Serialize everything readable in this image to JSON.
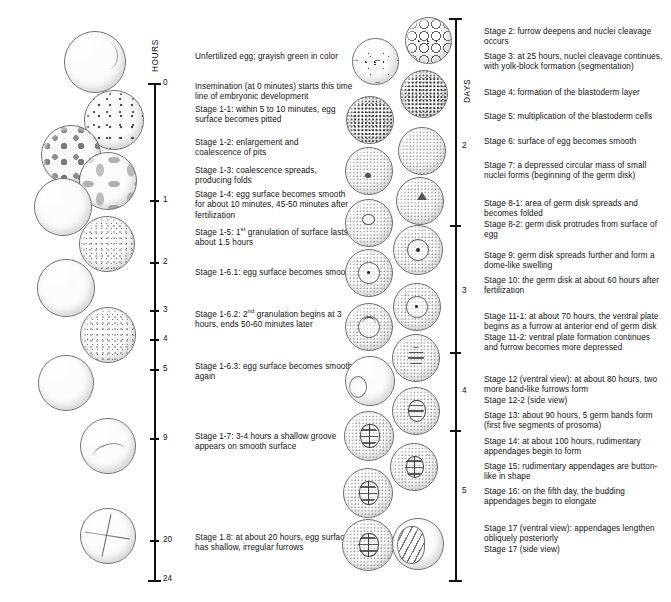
{
  "figure": {
    "left_axis": {
      "name": "HOURS",
      "ticks": [
        "0",
        "1",
        "2",
        "3",
        "4",
        "5",
        "9",
        "20",
        "24"
      ]
    },
    "right_axis": {
      "name": "DAYS",
      "ticks": [
        "2",
        "3",
        "4",
        "5"
      ]
    }
  },
  "left_captions": [
    {
      "id": "unfertilized",
      "text": "Unfertilized egg; grayish green in color"
    },
    {
      "id": "insemination",
      "text": "Insemination (at 0 minutes) starts this time line of embryonic development"
    },
    {
      "id": "stage-1-1",
      "text": "Stage 1-1: within 5 to 10 minutes, egg surface becomes pitted"
    },
    {
      "id": "stage-1-2",
      "text": "Stage 1-2: enlargement and coalescence of pits"
    },
    {
      "id": "stage-1-3",
      "text": "Stage 1-3: coalescence spreads, producing folds"
    },
    {
      "id": "stage-1-4",
      "text": "Stage 1-4: egg surface becomes smooth for about 10 minutes, 45-50 minutes after fertilization"
    },
    {
      "id": "stage-1-5",
      "text": "Stage 1-5: 1st granulation of surface lasts about 1.5 hours",
      "sup_token": "st",
      "prefix": "Stage 1-5: 1",
      "suffix": " granulation of surface lasts about 1.5 hours"
    },
    {
      "id": "stage-1-6-1",
      "text": "Stage 1-6.1: egg surface becomes smooth"
    },
    {
      "id": "stage-1-6-2",
      "text": "Stage 1-6.2: 2nd granulation begins at 3 hours, ends 50-60 minutes later",
      "sup_token": "nd",
      "prefix": "Stage 1-6.2: 2",
      "suffix": " granulation begins at 3 hours, ends 50-60 minutes later"
    },
    {
      "id": "stage-1-6-3",
      "text": "Stage 1-6.3: egg surface becomes smooth again"
    },
    {
      "id": "stage-1-7",
      "text": "Stage 1-7: 3-4 hours a shallow groove appears on smooth surface"
    },
    {
      "id": "stage-1-8",
      "text": "Stage 1.8: at about 20 hours, egg surface has shallow, irregular furrows"
    }
  ],
  "right_captions": [
    {
      "id": "stage-2",
      "text": "Stage 2: furrow deepens and nuclei cleavage occurs"
    },
    {
      "id": "stage-3",
      "text": "Stage 3: at 25 hours, nuclei cleavage continues, with yolk-block formation (segmentation)"
    },
    {
      "id": "stage-4",
      "text": "Stage 4: formation of the blastoderm layer"
    },
    {
      "id": "stage-5",
      "text": "Stage 5: multiplication of the blastoderm cells"
    },
    {
      "id": "stage-6",
      "text": "Stage 6: surface of egg becomes smooth"
    },
    {
      "id": "stage-7",
      "text": "Stage 7: a depressed circular mass of small nuclei forms (beginning of the germ disk)"
    },
    {
      "id": "stage-8",
      "text": "Stage 8-1: area of germ disk spreads and becomes folded\nStage 8-2: germ disk protrudes from surface of egg"
    },
    {
      "id": "stage-9",
      "text": "Stage 9: germ disk spreads further and form a dome-like swelling"
    },
    {
      "id": "stage-10",
      "text": "Stage 10: the germ disk at about 60 hours after fertilization"
    },
    {
      "id": "stage-11",
      "text": "Stage 11-1: at about 70 hours, the ventral plate begins as a furrow at anterior end of germ disk\nStage 11-2: ventral plate formation continues and furrow becomes more depressed"
    },
    {
      "id": "stage-12",
      "text": "Stage 12 (ventral view): at about 80 hours, two more band-like furrows form\nStage 12-2 (side view)"
    },
    {
      "id": "stage-13",
      "text": "Stage 13: about 90 hours, 5 germ bands form (first five segments of prosoma)"
    },
    {
      "id": "stage-14",
      "text": "Stage 14: at about 100 hours, rudimentary appendages begin to form"
    },
    {
      "id": "stage-15",
      "text": "Stage 15: rudimentary appendages are button-like in shape"
    },
    {
      "id": "stage-16",
      "text": "Stage 16: on the fifth day, the budding appendages begin to elongate"
    },
    {
      "id": "stage-17",
      "text": "Stage 17 (ventral view): appendages lengthen obliquely posteriorly\nStage 17 (side view)"
    }
  ],
  "colors": {
    "ink": "#111111",
    "outline": "#6c6c6c",
    "paper": "#ffffff"
  }
}
